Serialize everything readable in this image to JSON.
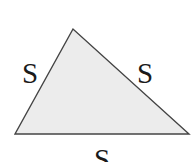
{
  "diagram": {
    "type": "triangle",
    "vertices": [
      {
        "name": "top",
        "x": 73,
        "y": 29
      },
      {
        "name": "bottom-left",
        "x": 15,
        "y": 134
      },
      {
        "name": "bottom-right",
        "x": 189,
        "y": 134
      }
    ],
    "fill_color": "#ececec",
    "stroke_color": "#444444",
    "labels": {
      "left_side": "S",
      "right_side": "S",
      "bottom_side": "S"
    }
  }
}
